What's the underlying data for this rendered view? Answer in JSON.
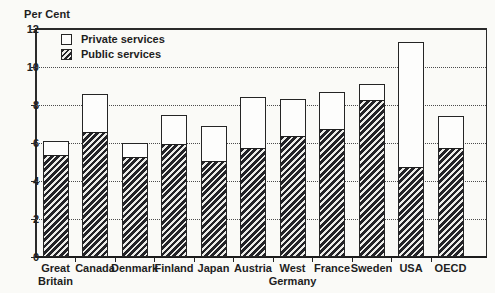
{
  "figure": {
    "background": "#fafaf7",
    "ink_color": "#1e1e1e"
  },
  "chart_data": {
    "type": "bar",
    "stacked": true,
    "axis_title": "Per Cent",
    "categories": [
      "Great Britain",
      "Canada",
      "Denmark",
      "Finland",
      "Japan",
      "Austria",
      "West Germany",
      "France",
      "Sweden",
      "USA",
      "OECD"
    ],
    "series": [
      {
        "name": "Public services",
        "style": "hatched",
        "values": [
          5.3,
          6.5,
          5.2,
          5.9,
          5.0,
          5.7,
          6.3,
          6.7,
          8.2,
          4.7,
          5.7
        ]
      },
      {
        "name": "Private services",
        "style": "white",
        "values": [
          0.8,
          2.1,
          0.8,
          1.6,
          1.9,
          2.7,
          2.0,
          2.0,
          0.9,
          6.6,
          1.7
        ]
      }
    ],
    "totals": [
      6.1,
      8.6,
      6.0,
      7.5,
      6.9,
      8.4,
      8.3,
      8.7,
      9.1,
      11.3,
      7.4
    ],
    "ylim": [
      0,
      12
    ],
    "yticks": [
      0,
      2,
      4,
      6,
      8,
      10,
      12
    ],
    "grid": "dotted horizontal gridlines at 2,4,6,8,10; solid top frame at 12",
    "legend_position": "top-left inside plot"
  },
  "legend": {
    "items": [
      {
        "label": "Private services",
        "swatch": "white-square"
      },
      {
        "label": "Public services",
        "swatch": "hatched-square"
      }
    ]
  }
}
